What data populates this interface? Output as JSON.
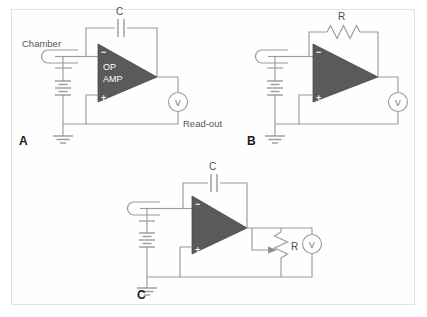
{
  "figure": {
    "border_color": "#e2e2e2",
    "background": "#ffffff",
    "wire_color": "#9a9a9a",
    "opamp_fill": "#5a5a5a",
    "label_color": "#555555"
  },
  "panels": [
    {
      "id": "A",
      "letter": "A",
      "opamp_label_line1": "OP",
      "opamp_label_line2": "AMP",
      "minus_sign": "−",
      "plus_sign": "+",
      "feedback_component": "C",
      "feedback_component_type": "capacitor",
      "chamber_label": "Chamber",
      "meter_label": "V",
      "readout_label": "Read-out",
      "ground_name": "ground",
      "battery_name": "battery"
    },
    {
      "id": "B",
      "letter": "B",
      "opamp_label_line1": "",
      "opamp_label_line2": "",
      "minus_sign": "−",
      "plus_sign": "+",
      "feedback_component": "R",
      "feedback_component_type": "resistor",
      "chamber_label": "",
      "meter_label": "V",
      "readout_label": "",
      "ground_name": "ground",
      "battery_name": "battery"
    },
    {
      "id": "C",
      "letter": "C",
      "opamp_label_line1": "",
      "opamp_label_line2": "",
      "minus_sign": "−",
      "plus_sign": "+",
      "feedback_component": "C",
      "feedback_component_type": "capacitor",
      "output_component": "R",
      "output_component_type": "potentiometer",
      "chamber_label": "",
      "meter_label": "V",
      "readout_label": "",
      "ground_name": "ground",
      "battery_name": "battery"
    }
  ]
}
